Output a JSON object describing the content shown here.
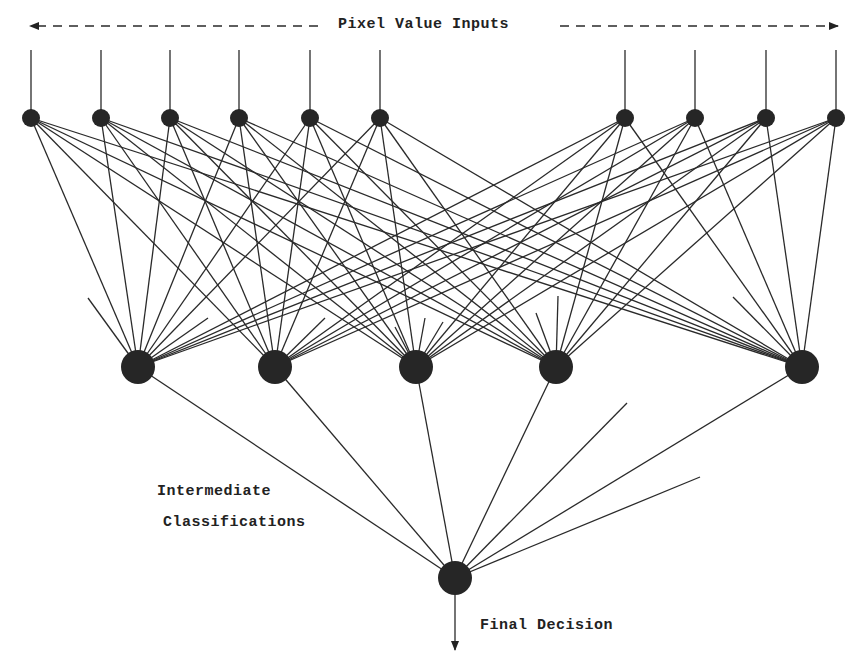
{
  "diagram": {
    "type": "neural-network",
    "labels": {
      "inputs": "Pixel Value Inputs",
      "intermediate_line1": "Intermediate",
      "intermediate_line2": "Classifications",
      "final": "Final Decision"
    },
    "colors": {
      "node": "#262626",
      "line": "#2a2a2a",
      "text": "#222222",
      "background": "#ffffff"
    },
    "input_arrow": {
      "y": 26,
      "left_x": 30,
      "right_x": 838,
      "gap_left": 318,
      "gap_right": 560
    },
    "input_layer": {
      "y": 118,
      "line_top": 50,
      "radius": 9,
      "x": [
        31,
        101,
        170,
        239,
        310,
        380,
        625,
        695,
        766,
        836
      ]
    },
    "hidden_layer": {
      "y": 367,
      "radius": 17,
      "x": [
        138,
        275,
        416,
        556,
        802
      ]
    },
    "output_node": {
      "x": 455,
      "y": 578,
      "radius": 17,
      "arrow_end_y": 650
    },
    "stubs": [
      {
        "from": 0,
        "to": [
          88,
          298
        ]
      },
      {
        "from": 0,
        "to": [
          208,
          318
        ]
      },
      {
        "from": 1,
        "to": [
          325,
          318
        ]
      },
      {
        "from": 2,
        "to": [
          395,
          327
        ]
      },
      {
        "from": 2,
        "to": [
          425,
          318
        ]
      },
      {
        "from": 2,
        "to": [
          443,
          322
        ]
      },
      {
        "from": 3,
        "to": [
          536,
          313
        ]
      },
      {
        "from": 3,
        "to": [
          558,
          296
        ]
      },
      {
        "from": 4,
        "to": [
          733,
          297
        ]
      }
    ],
    "output_stubs": [
      [
        627,
        403
      ],
      [
        700,
        477
      ]
    ]
  }
}
